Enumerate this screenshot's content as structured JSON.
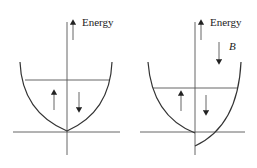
{
  "diagram": {
    "type": "band-diagram",
    "panels": [
      {
        "id": "left",
        "axis_label": "Energy",
        "spin_up_label": "↑",
        "spin_down_label": "↓",
        "field": null
      },
      {
        "id": "right",
        "axis_label": "Energy",
        "field_label": "B",
        "spin_up_label": "↑",
        "spin_down_label": "↓"
      }
    ],
    "colors": {
      "line": "#333333",
      "background": "#ffffff"
    }
  }
}
